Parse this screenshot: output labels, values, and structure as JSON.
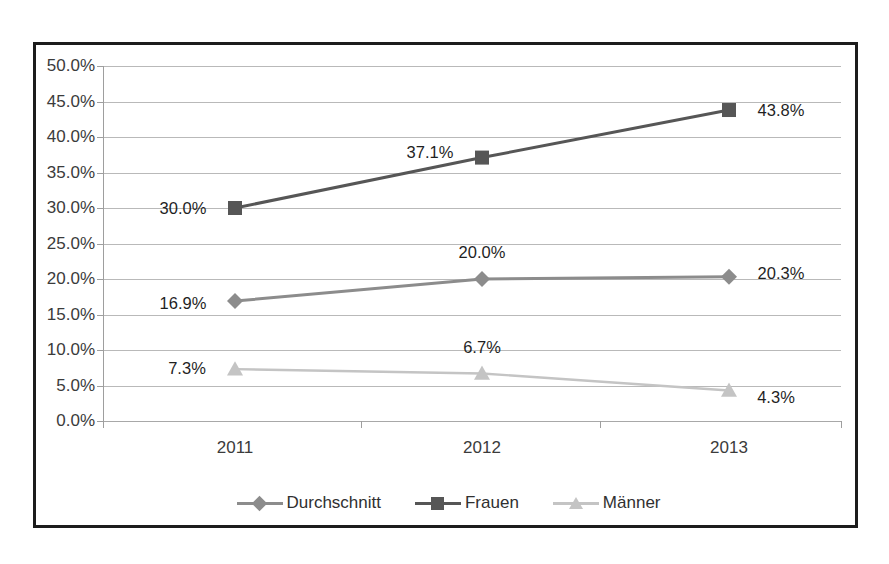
{
  "chart_title": "",
  "chart_data": {
    "type": "line",
    "title": "",
    "xlabel": "",
    "ylabel": "",
    "categories": [
      "2011",
      "2012",
      "2013"
    ],
    "ylim": [
      0,
      50
    ],
    "ytick_labels": [
      "50.0%",
      "45.0%",
      "40.0%",
      "35.0%",
      "30.0%",
      "25.0%",
      "20.0%",
      "15.0%",
      "10.0%",
      "5.0%",
      "0.0%"
    ],
    "ytick_values": [
      50,
      45,
      40,
      35,
      30,
      25,
      20,
      15,
      10,
      5,
      0
    ],
    "grid": true,
    "legend_position": "bottom",
    "series": [
      {
        "name": "Durchschnitt",
        "marker": "diamond",
        "color": "#8c8c8c",
        "values": [
          16.9,
          20.0,
          20.3
        ],
        "data_labels": [
          "16.9%",
          "20.0%",
          "20.3%"
        ]
      },
      {
        "name": "Frauen",
        "marker": "square",
        "color": "#565656",
        "values": [
          30.0,
          37.1,
          43.8
        ],
        "data_labels": [
          "30.0%",
          "37.1%",
          "43.8%"
        ]
      },
      {
        "name": "Männer",
        "marker": "triangle",
        "color": "#c4c4c4",
        "values": [
          7.3,
          6.7,
          4.3
        ],
        "data_labels": [
          "7.3%",
          "6.7%",
          "4.3%"
        ]
      }
    ]
  },
  "legend": {
    "items": [
      {
        "label": "Durchschnitt"
      },
      {
        "label": "Frauen"
      },
      {
        "label": "Männer"
      }
    ]
  }
}
